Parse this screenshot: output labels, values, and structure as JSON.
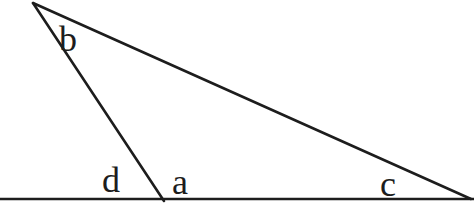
{
  "diagram": {
    "labels": {
      "apex_angle": "b",
      "exterior_left_angle": "d",
      "interior_left_angle": "a",
      "interior_right_angle": "c"
    },
    "colors": {
      "line": "#1d1d1d",
      "background": "#ffffff"
    }
  }
}
